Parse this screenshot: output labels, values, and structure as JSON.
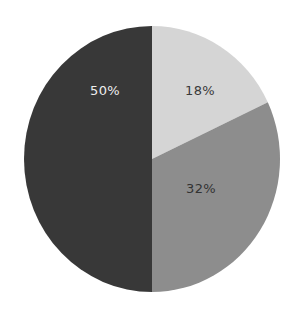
{
  "chart_data": {
    "type": "pie",
    "title": "",
    "categories": [
      "Slice A",
      "Slice B",
      "Slice C"
    ],
    "values": [
      18,
      32,
      50
    ],
    "labels": [
      "18%",
      "32%",
      "50%"
    ],
    "colors": [
      "#d5d5d5",
      "#8d8d8d",
      "#383838"
    ],
    "label_colors": [
      "#3a3a3a",
      "#333333",
      "#eeeeee"
    ],
    "start_angle_deg": 0,
    "direction": "clockwise",
    "legend": "none"
  },
  "slices": [
    {
      "label": "18%"
    },
    {
      "label": "32%"
    },
    {
      "label": "50%"
    }
  ]
}
